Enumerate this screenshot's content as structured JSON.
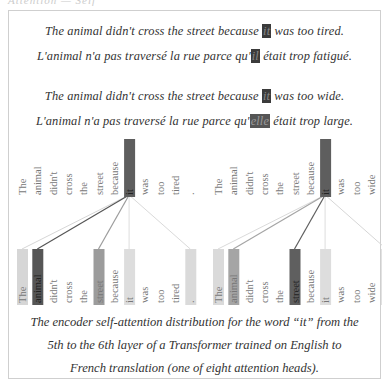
{
  "header": {
    "cropped_title": "Attention — Self"
  },
  "examples": [
    {
      "en": {
        "before": "The animal didn't cross the street because ",
        "highlight": "it",
        "after": " was too tired."
      },
      "fr": {
        "before": "L'animal n'a pas traversé la rue parce qu'",
        "highlight": "il",
        "after": " était trop fatigué."
      }
    },
    {
      "en": {
        "before": "The animal didn't cross the street because ",
        "highlight": "it",
        "after": " was too wide."
      },
      "fr": {
        "before": "L'animal n'a pas traversé la rue parce qu'",
        "highlight": "elle",
        "after": " était trop large."
      }
    }
  ],
  "diagrams": [
    {
      "name": "tired",
      "tokens": [
        "The",
        "animal",
        "didn't",
        "cross",
        "the",
        "street",
        "because",
        "it",
        "was",
        "too",
        "tired",
        "."
      ],
      "source_token": "it",
      "attention": [
        0.12,
        0.85,
        0,
        0,
        0,
        0.45,
        0,
        0.08,
        0,
        0,
        0,
        0.1
      ]
    },
    {
      "name": "wide",
      "tokens": [
        "The",
        "animal",
        "didn't",
        "cross",
        "the",
        "street",
        "because",
        "it",
        "was",
        "too",
        "wide",
        "."
      ],
      "source_token": "it",
      "attention": [
        0.1,
        0.4,
        0,
        0,
        0,
        0.8,
        0,
        0.08,
        0,
        0,
        0,
        0.12
      ]
    }
  ],
  "caption": {
    "line1": "The encoder self-attention distribution for the word “it” from the",
    "line2": "5th to the 6th layer of a Transformer trained on English to",
    "line3": "French translation (one of eight attention heads)."
  },
  "colors": {
    "text": "#333333",
    "frame": "#cfcfcf",
    "highlight": "#3b3b3b"
  }
}
